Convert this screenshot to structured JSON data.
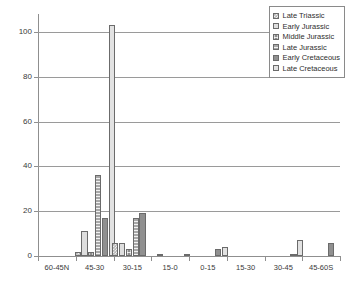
{
  "chart_data": {
    "type": "bar",
    "title": "",
    "xlabel": "",
    "ylabel": "",
    "ylim": [
      0,
      108
    ],
    "yticks": [
      0,
      20,
      40,
      60,
      80,
      100
    ],
    "grid": true,
    "legend_position": "top-right",
    "categories": [
      "60-45N",
      "45-30",
      "30-15",
      "15-0",
      "0-15",
      "15-30",
      "30-45",
      "45-60S"
    ],
    "series": [
      {
        "name": "Late Triassic",
        "key": "p-lt",
        "values": [
          0,
          2,
          6,
          0,
          0,
          0,
          0,
          0
        ]
      },
      {
        "name": "Early Jurassic",
        "key": "p-ej",
        "values": [
          0,
          11,
          6,
          1,
          0,
          0,
          0,
          0
        ]
      },
      {
        "name": "Middle Jurassic",
        "key": "p-mj",
        "values": [
          0,
          2,
          3,
          0,
          0,
          0,
          0,
          0
        ]
      },
      {
        "name": "Late Jurassic",
        "key": "p-lj",
        "values": [
          0,
          36,
          17,
          0,
          0,
          0,
          0,
          0
        ]
      },
      {
        "name": "Early Cretaceous",
        "key": "p-ec",
        "values": [
          0,
          17,
          19,
          0,
          3,
          0,
          1,
          6
        ]
      },
      {
        "name": "Late Cretaceous",
        "key": "p-lc",
        "values": [
          0,
          103,
          0,
          1,
          4,
          0,
          7,
          0
        ]
      }
    ]
  },
  "legend": {
    "items": [
      {
        "label": "Late Triassic",
        "pattern": "p-lt"
      },
      {
        "label": "Early Jurassic",
        "pattern": "p-ej"
      },
      {
        "label": "Middle Jurassic",
        "pattern": "p-mj"
      },
      {
        "label": "Late Jurassic",
        "pattern": "p-lj"
      },
      {
        "label": "Early Cretaceous",
        "pattern": "p-ec"
      },
      {
        "label": "Late Cretaceous",
        "pattern": "p-lc"
      }
    ]
  },
  "axes": {
    "y_tick_labels": [
      "0",
      "20",
      "40",
      "60",
      "80",
      "100"
    ],
    "x_tick_labels": [
      "60-45N",
      "45-30",
      "30-15",
      "15-0",
      "0-15",
      "15-30",
      "30-45",
      "45-60S"
    ]
  },
  "colors": {
    "axis": "#8f8f8f",
    "grid": "#9a9a9a",
    "text": "#3a3a3a",
    "bar_outline": "#6b6b6b"
  }
}
